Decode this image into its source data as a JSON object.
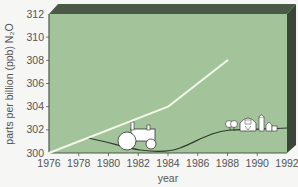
{
  "chart_data": {
    "type": "line",
    "title": "",
    "xlabel": "year",
    "ylabel": "parts per billion (ppb) N₂O",
    "xlim": [
      1976,
      1992
    ],
    "ylim": [
      300,
      312
    ],
    "x_ticks": [
      "1976",
      "1978",
      "1980",
      "1982",
      "1984",
      "1986",
      "1988",
      "1990",
      "1992"
    ],
    "y_ticks": [
      "300",
      "302",
      "304",
      "306",
      "308",
      "310",
      "312"
    ],
    "grid": false,
    "legend": "none",
    "series": [
      {
        "name": "N2O concentration",
        "color": "#f4f8e8",
        "x": [
          1976,
          1984,
          1988
        ],
        "y": [
          300,
          304,
          308
        ]
      }
    ],
    "annotations": [
      "tractor-illustration",
      "farm-illustration (trees, barn, silo, shed)"
    ],
    "colors": {
      "plot_bg": "#a3c39a",
      "frame_dark": "#3e4a3c",
      "frame_top": "#4b5a48",
      "ground_line": "#2e3a2c"
    }
  }
}
